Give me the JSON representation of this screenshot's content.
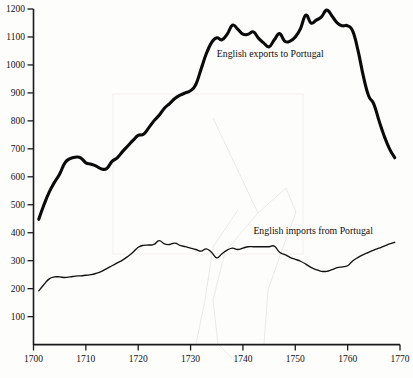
{
  "chart_data": {
    "type": "line",
    "title": "",
    "subtitle": "",
    "xlabel": "",
    "ylabel": "",
    "xlim": [
      1700,
      1770
    ],
    "ylim": [
      0,
      1200
    ],
    "grid": false,
    "legend_position": "inline-annotation",
    "x_ticks": [
      "1700",
      "1710",
      "1720",
      "1730",
      "1740",
      "1750",
      "1760",
      "1770"
    ],
    "x_tick_values": [
      1700,
      1710,
      1720,
      1730,
      1740,
      1750,
      1760,
      1770
    ],
    "y_ticks": [
      "100",
      "200",
      "300",
      "400",
      "500",
      "600",
      "700",
      "800",
      "900",
      "1000",
      "1100",
      "1200"
    ],
    "y_tick_values": [
      100,
      200,
      300,
      400,
      500,
      600,
      700,
      800,
      900,
      1000,
      1100,
      1200
    ],
    "series": [
      {
        "name": "English exports to Portugal",
        "label": "English exports to Portugal",
        "color": "#0a0a0a",
        "line_width": 3.1,
        "x": [
          1701,
          1702,
          1703,
          1704,
          1705,
          1706,
          1707,
          1708,
          1709,
          1710,
          1711,
          1712,
          1713,
          1714,
          1715,
          1716,
          1717,
          1718,
          1719,
          1720,
          1721,
          1722,
          1723,
          1724,
          1725,
          1726,
          1727,
          1728,
          1729,
          1730,
          1731,
          1732,
          1733,
          1734,
          1735,
          1736,
          1737,
          1738,
          1739,
          1740,
          1741,
          1742,
          1743,
          1744,
          1745,
          1746,
          1747,
          1748,
          1749,
          1750,
          1751,
          1752,
          1753,
          1754,
          1755,
          1756,
          1757,
          1758,
          1759,
          1760,
          1761,
          1762,
          1763,
          1764,
          1765,
          1766,
          1767,
          1768,
          1769
        ],
        "values": [
          448,
          500,
          545,
          580,
          610,
          650,
          665,
          670,
          668,
          650,
          645,
          638,
          628,
          630,
          655,
          668,
          690,
          710,
          730,
          748,
          752,
          775,
          800,
          820,
          845,
          862,
          880,
          892,
          900,
          908,
          930,
          985,
          1040,
          1080,
          1097,
          1090,
          1110,
          1142,
          1128,
          1110,
          1110,
          1118,
          1095,
          1078,
          1065,
          1090,
          1112,
          1085,
          1085,
          1100,
          1130,
          1178,
          1150,
          1160,
          1172,
          1196,
          1175,
          1150,
          1140,
          1140,
          1120,
          1050,
          960,
          890,
          860,
          800,
          745,
          700,
          668
        ]
      },
      {
        "name": "English imports from Portugal",
        "label": "English imports from Portugal",
        "color": "#121212",
        "line_width": 1.35,
        "x": [
          1701,
          1702,
          1703,
          1704,
          1705,
          1706,
          1707,
          1708,
          1709,
          1710,
          1711,
          1712,
          1713,
          1714,
          1715,
          1716,
          1717,
          1718,
          1719,
          1720,
          1721,
          1722,
          1723,
          1724,
          1725,
          1726,
          1727,
          1728,
          1729,
          1730,
          1731,
          1732,
          1733,
          1734,
          1735,
          1736,
          1737,
          1738,
          1739,
          1740,
          1741,
          1742,
          1743,
          1744,
          1745,
          1746,
          1747,
          1748,
          1749,
          1750,
          1751,
          1752,
          1753,
          1754,
          1755,
          1756,
          1757,
          1758,
          1759,
          1760,
          1761,
          1762,
          1763,
          1764,
          1765,
          1766,
          1767,
          1768,
          1769
        ],
        "values": [
          192,
          215,
          235,
          242,
          242,
          240,
          242,
          245,
          246,
          248,
          250,
          255,
          262,
          272,
          282,
          292,
          302,
          315,
          330,
          348,
          355,
          356,
          358,
          372,
          360,
          358,
          363,
          355,
          350,
          345,
          340,
          334,
          342,
          330,
          310,
          325,
          338,
          345,
          340,
          345,
          350,
          350,
          350,
          350,
          350,
          352,
          330,
          322,
          312,
          305,
          298,
          288,
          276,
          268,
          262,
          262,
          268,
          275,
          278,
          282,
          300,
          312,
          322,
          330,
          338,
          345,
          352,
          360,
          366
        ]
      }
    ],
    "annotations": [
      {
        "text": "English exports to Portugal",
        "x": 1735,
        "y": 1030
      },
      {
        "text": "English imports from Portugal",
        "x": 1742,
        "y": 395
      }
    ]
  }
}
